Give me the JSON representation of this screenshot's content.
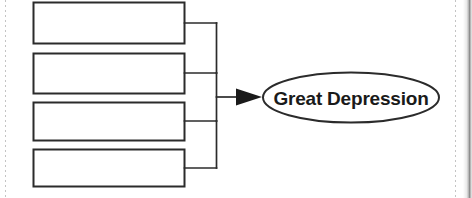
{
  "page": {
    "background_color": "#ffffff",
    "ink_color": "#231f20",
    "width": 472,
    "height": 198
  },
  "diagram": {
    "type": "cause-effect-bracket",
    "title": "",
    "cause_boxes": [
      {
        "label": "",
        "placeholder": ""
      },
      {
        "label": "",
        "placeholder": ""
      },
      {
        "label": "",
        "placeholder": ""
      },
      {
        "label": "",
        "placeholder": ""
      }
    ],
    "effect": {
      "label": "Great Depression",
      "shape": "ellipse"
    },
    "connector": {
      "kind": "nested-bracket",
      "arrow": "right-triangle"
    }
  },
  "scan_marks": {
    "left_guide": "dashed-vertical-rule",
    "right_guide": "dashed-vertical-rule",
    "gutter": "page-edge-shadow"
  }
}
